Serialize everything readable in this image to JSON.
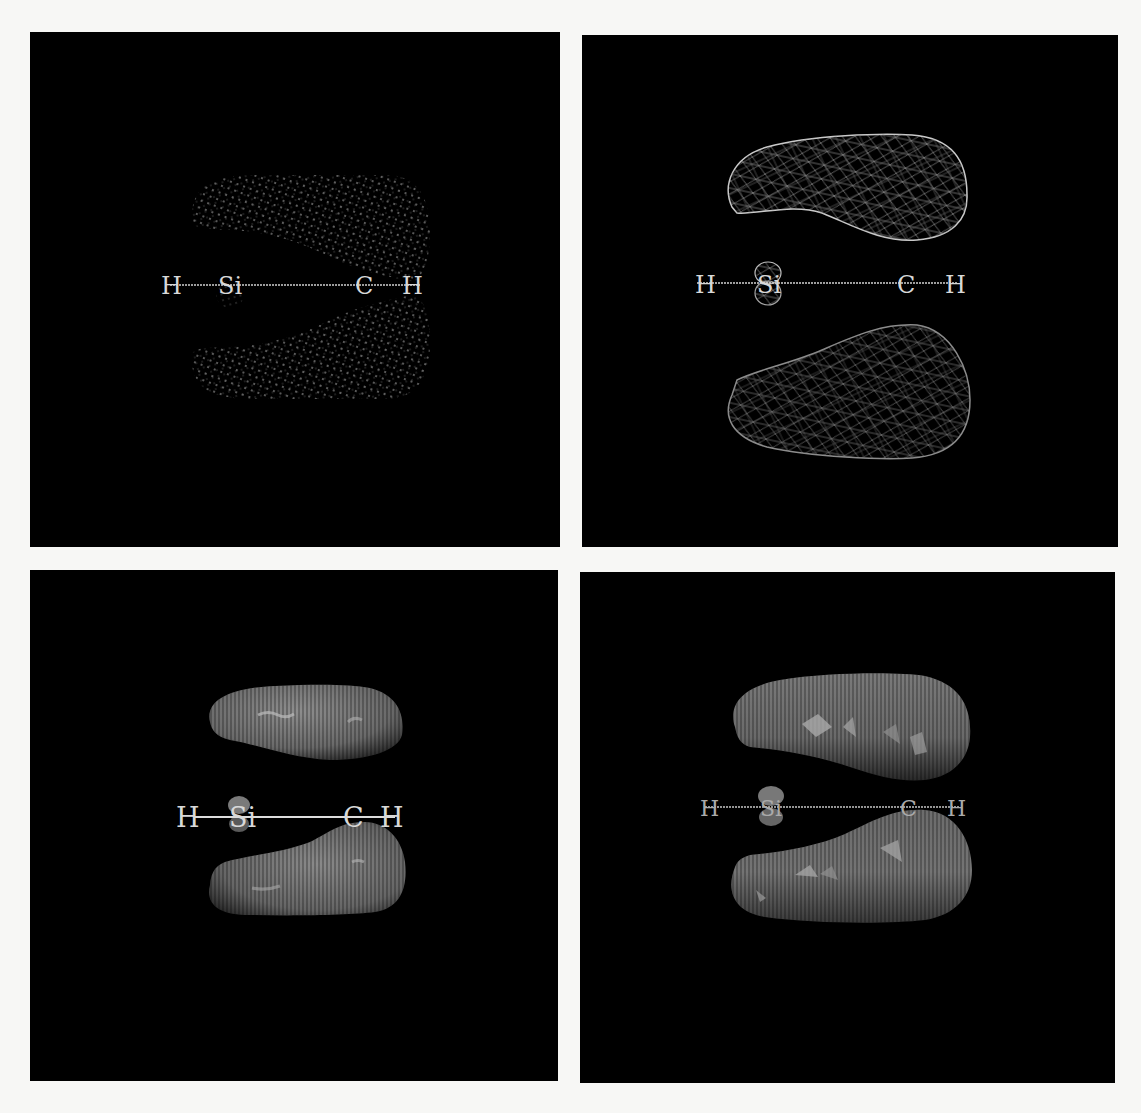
{
  "figure": {
    "background_color": "#f7f7f5",
    "panel_color": "#000000",
    "panels": [
      {
        "id": "top-left",
        "style": "dots",
        "atoms": [
          "H",
          "Si",
          "C",
          "H"
        ],
        "surface_color": "#9a9a9a"
      },
      {
        "id": "top-right",
        "style": "wireframe",
        "atoms": [
          "H",
          "Si",
          "C",
          "H"
        ],
        "surface_color": "#bdbdbd"
      },
      {
        "id": "bottom-left",
        "style": "smooth-solid",
        "atoms": [
          "H",
          "Si",
          "C",
          "H"
        ],
        "surface_color": "#7a7a7a"
      },
      {
        "id": "bottom-right",
        "style": "faceted-solid",
        "atoms": [
          "H",
          "Si",
          "C",
          "H"
        ],
        "surface_color": "#6e6e6e"
      }
    ]
  }
}
